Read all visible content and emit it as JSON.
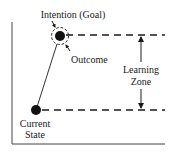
{
  "diagram": {
    "labels": {
      "goal": "Intention (Goal)",
      "outcome": "Outcome",
      "learning_line1": "Learning",
      "learning_line2": "Zone",
      "current_line1": "Current",
      "current_line2": "State"
    },
    "colors": {
      "ink": "#1a1a1a",
      "axis": "#444444",
      "background": "#ffffff"
    }
  }
}
